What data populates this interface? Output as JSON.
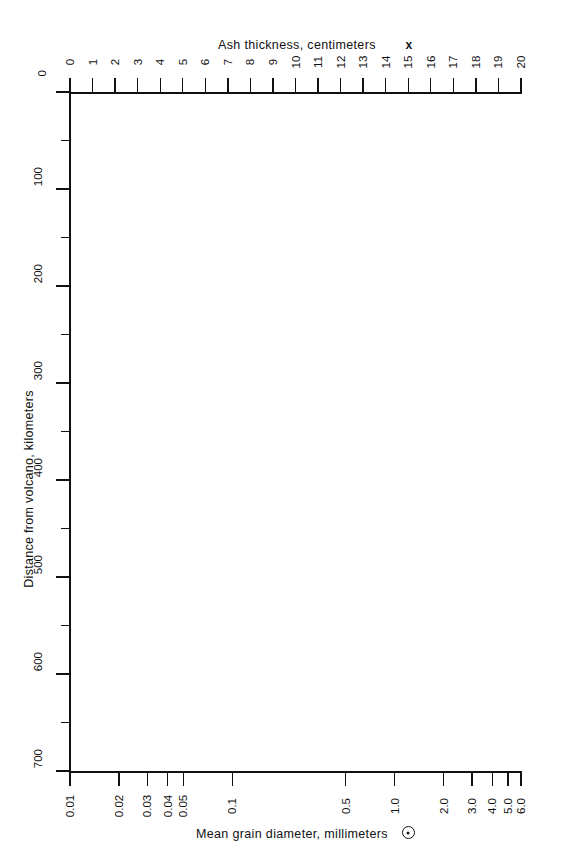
{
  "chart_data": {
    "type": "scatter",
    "title": "",
    "subtitle": "",
    "grid": false,
    "legend_position": "in-axis-titles",
    "series": [],
    "data_points": [],
    "note": "Blank plotting template; no data points are drawn inside the plot area.",
    "axes": {
      "top": {
        "label": "Ash thickness, centimeters",
        "marker_symbol": "x",
        "marker_name": "x-marker",
        "scale": "linear",
        "range": [
          0,
          20
        ],
        "tick_step": 1,
        "tick_label_rotation_deg": -90,
        "ticks": [
          0,
          1,
          2,
          3,
          4,
          5,
          6,
          7,
          8,
          9,
          10,
          11,
          12,
          13,
          14,
          15,
          16,
          17,
          18,
          19,
          20
        ],
        "tick_labels": [
          "0",
          "1",
          "2",
          "3",
          "4",
          "5",
          "6",
          "7",
          "8",
          "9",
          "10",
          "11",
          "12",
          "13",
          "14",
          "15",
          "16",
          "17",
          "18",
          "19",
          "20"
        ]
      },
      "bottom": {
        "label": "Mean grain diameter, millimeters",
        "marker_symbol": "circle-dot",
        "marker_name": "circle-dot-marker",
        "scale": "log",
        "range": [
          0.01,
          6.0
        ],
        "tick_label_rotation_deg": -90,
        "ticks": [
          0.01,
          0.02,
          0.03,
          0.04,
          0.05,
          0.1,
          0.5,
          1.0,
          2.0,
          3.0,
          4.0,
          5.0,
          6.0
        ],
        "tick_labels": [
          "0.01",
          "0.02",
          "0.03",
          "0.04",
          "0.05",
          "0.1",
          "0.5",
          "1.0",
          "2.0",
          "3.0",
          "4.0",
          "5.0",
          "6.0"
        ]
      },
      "left": {
        "label": "Distance from volcano, kilometers",
        "scale": "linear",
        "range": [
          0,
          700
        ],
        "direction": "top-to-bottom-increasing",
        "major_tick_step": 100,
        "minor_tick_step": 50,
        "tick_label_rotation_deg": -90,
        "major_ticks": [
          0,
          100,
          200,
          300,
          400,
          500,
          600,
          700
        ],
        "major_tick_labels": [
          "0",
          "100",
          "200",
          "300",
          "400",
          "500",
          "600",
          "700"
        ],
        "minor_ticks": [
          50,
          150,
          250,
          350,
          450,
          550,
          650
        ]
      }
    },
    "colors": {
      "ink": "#111111",
      "background": "#ffffff"
    }
  },
  "top_axis_title": {
    "text": "Ash thickness, centimeters",
    "marker": "x"
  },
  "bottom_axis_title": {
    "text": "Mean grain diameter, millimeters"
  },
  "left_axis_title": {
    "text": "Distance from volcano, kilometers"
  }
}
